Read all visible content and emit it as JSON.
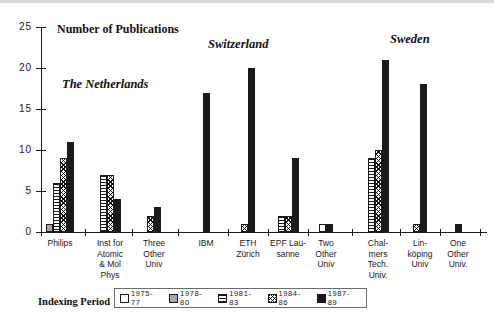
{
  "chart_data": {
    "type": "bar",
    "title": "Number of Publications",
    "xlabel": "",
    "ylabel": "Number of Publications",
    "ylim": [
      0,
      25
    ],
    "yticks": [
      0,
      5,
      10,
      15,
      20,
      25
    ],
    "grid": false,
    "legend_position": "bottom",
    "legend_title": "Indexing Period",
    "series": [
      {
        "name": "1975-77",
        "pattern": "open-white",
        "values": [
          0,
          0,
          0,
          0,
          0,
          0,
          1,
          0,
          0,
          0
        ]
      },
      {
        "name": "1978-80",
        "pattern": "solid-grey",
        "values": [
          1,
          0,
          0,
          0,
          0,
          0,
          0,
          0,
          0,
          0
        ]
      },
      {
        "name": "1981-83",
        "pattern": "horizontal-lines",
        "values": [
          6,
          7,
          0,
          0,
          0,
          2,
          0,
          9,
          0,
          0
        ]
      },
      {
        "name": "1984-86",
        "pattern": "cross-hatch",
        "values": [
          9,
          7,
          2,
          0,
          1,
          2,
          0,
          10,
          1,
          0
        ]
      },
      {
        "name": "1987-89",
        "pattern": "solid-black",
        "values": [
          11,
          4,
          3,
          17,
          20,
          9,
          1,
          21,
          18,
          1
        ]
      }
    ],
    "categories": [
      "Philips",
      "Inst for Atomic & Mol Phys",
      "Three Other Univ",
      "IBM",
      "ETH Zürich",
      "EPF Lausanne",
      "Two Other Univ",
      "Chalmers Tech. Univ.",
      "Linköping Univ",
      "One Other Univ."
    ],
    "groups": [
      {
        "label": "The Netherlands",
        "categories": [
          "Philips",
          "Inst for Atomic & Mol Phys",
          "Three Other Univ"
        ]
      },
      {
        "label": "Switzerland",
        "categories": [
          "IBM",
          "ETH Zürich",
          "EPF Lausanne",
          "Two Other Univ"
        ]
      },
      {
        "label": "Sweden",
        "categories": [
          "Chalmers Tech. Univ.",
          "Linköping Univ",
          "One Other Univ."
        ]
      }
    ]
  },
  "axis": {
    "title": "Number of Publications",
    "ticks": [
      "25",
      "20",
      "15",
      "10",
      "5",
      "0"
    ]
  },
  "groups": [
    {
      "name": "The Netherlands"
    },
    {
      "name": "Switzerland"
    },
    {
      "name": "Sweden"
    }
  ],
  "categories": [
    {
      "l1": "Philips",
      "l2": "",
      "l3": "",
      "l4": ""
    },
    {
      "l1": "Inst for",
      "l2": "Atomic",
      "l3": "& Mol",
      "l4": "Phys"
    },
    {
      "l1": "Three",
      "l2": "Other",
      "l3": "Univ",
      "l4": ""
    },
    {
      "l1": "IBM",
      "l2": "",
      "l3": "",
      "l4": ""
    },
    {
      "l1": "ETH",
      "l2": "Zürich",
      "l3": "",
      "l4": ""
    },
    {
      "l1": "EPF Lau-",
      "l2": "sanne",
      "l3": "",
      "l4": ""
    },
    {
      "l1": "Two",
      "l2": "Other",
      "l3": "Univ",
      "l4": ""
    },
    {
      "l1": "Chal-",
      "l2": "mers",
      "l3": "Tech.",
      "l4": "Univ."
    },
    {
      "l1": "Lin-",
      "l2": "köping",
      "l3": "Univ",
      "l4": ""
    },
    {
      "l1": "One",
      "l2": "Other",
      "l3": "Univ.",
      "l4": ""
    }
  ],
  "legend": {
    "label": "Indexing Period",
    "items": [
      {
        "text": "1975-77"
      },
      {
        "text": "1978-80"
      },
      {
        "text": "1981-83"
      },
      {
        "text": "1984-86"
      },
      {
        "text": "1987-89"
      }
    ]
  },
  "colors": {
    "axis": "#1a1a1a",
    "solid_black": "#1a1a1a",
    "grey": "#a8a8a8",
    "white": "#ffffff",
    "legend_border": "#6b6b6b"
  }
}
